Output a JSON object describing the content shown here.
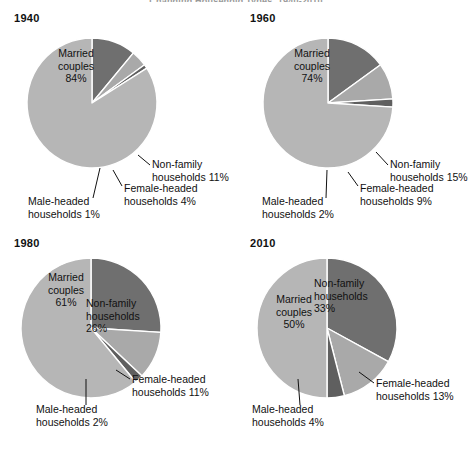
{
  "figure": {
    "title": "Changing Household Types, 1940-2010",
    "background": "#ffffff"
  },
  "colors": {
    "married": "#b6b6b6",
    "nonfamily": "#6f6f6f",
    "female_headed": "#a9a9a9",
    "male_headed": "#5f5f5f",
    "text": "#111111",
    "separator": "#ffffff"
  },
  "legend_categories": [
    "Married couples",
    "Non-family households",
    "Female-headed households",
    "Male-headed households"
  ],
  "panels": [
    {
      "year": "1940",
      "labels": {
        "married": {
          "line1": "Married",
          "line2": "couples",
          "line3": "84%"
        },
        "nonfamily": {
          "line1": "Non-family",
          "line2": "households 11%"
        },
        "female": {
          "line1": "Female-headed",
          "line2": "households 4%"
        },
        "male": {
          "line1": "Male-headed",
          "line2": "households 1%"
        }
      }
    },
    {
      "year": "1960",
      "labels": {
        "married": {
          "line1": "Married",
          "line2": "couples",
          "line3": "74%"
        },
        "nonfamily": {
          "line1": "Non-family",
          "line2": "households 15%"
        },
        "female": {
          "line1": "Female-headed",
          "line2": "households 9%"
        },
        "male": {
          "line1": "Male-headed",
          "line2": "households 2%"
        }
      }
    },
    {
      "year": "1980",
      "labels": {
        "married": {
          "line1": "Married",
          "line2": "couples",
          "line3": "61%"
        },
        "nonfamily": {
          "line1": "Non-family",
          "line2": "households",
          "line3": "26%"
        },
        "female": {
          "line1": "Female-headed",
          "line2": "households 11%"
        },
        "male": {
          "line1": "Male-headed",
          "line2": "households 2%"
        }
      }
    },
    {
      "year": "2010",
      "labels": {
        "married": {
          "line1": "Married",
          "line2": "couples",
          "line3": "50%"
        },
        "nonfamily": {
          "line1": "Non-family",
          "line2": "households",
          "line3": "33%"
        },
        "female": {
          "line1": "Female-headed",
          "line2": "households 13%"
        },
        "male": {
          "line1": "Male-headed",
          "line2": "households 4%"
        }
      }
    }
  ],
  "chart_data": {
    "type": "pie",
    "title": "Changing Household Types, 1940-2010",
    "unit": "percent",
    "categories": [
      "Married couples",
      "Non-family households",
      "Female-headed households",
      "Male-headed households"
    ],
    "charts": [
      {
        "title": "1940",
        "values": [
          84,
          11,
          4,
          1
        ],
        "slices": [
          {
            "label": "Married couples",
            "value": 84,
            "color": "#b6b6b6"
          },
          {
            "label": "Non-family households",
            "value": 11,
            "color": "#6f6f6f"
          },
          {
            "label": "Female-headed households",
            "value": 4,
            "color": "#a9a9a9"
          },
          {
            "label": "Male-headed households",
            "value": 1,
            "color": "#5f5f5f"
          }
        ]
      },
      {
        "title": "1960",
        "values": [
          74,
          15,
          9,
          2
        ],
        "slices": [
          {
            "label": "Married couples",
            "value": 74,
            "color": "#b6b6b6"
          },
          {
            "label": "Non-family households",
            "value": 15,
            "color": "#6f6f6f"
          },
          {
            "label": "Female-headed households",
            "value": 9,
            "color": "#a9a9a9"
          },
          {
            "label": "Male-headed households",
            "value": 2,
            "color": "#5f5f5f"
          }
        ]
      },
      {
        "title": "1980",
        "values": [
          61,
          26,
          11,
          2
        ],
        "slices": [
          {
            "label": "Married couples",
            "value": 61,
            "color": "#b6b6b6"
          },
          {
            "label": "Non-family households",
            "value": 26,
            "color": "#6f6f6f"
          },
          {
            "label": "Female-headed households",
            "value": 11,
            "color": "#a9a9a9"
          },
          {
            "label": "Male-headed households",
            "value": 2,
            "color": "#5f5f5f"
          }
        ]
      },
      {
        "title": "2010",
        "values": [
          50,
          33,
          13,
          4
        ],
        "slices": [
          {
            "label": "Married couples",
            "value": 50,
            "color": "#b6b6b6"
          },
          {
            "label": "Non-family households",
            "value": 33,
            "color": "#6f6f6f"
          },
          {
            "label": "Female-headed households",
            "value": 13,
            "color": "#a9a9a9"
          },
          {
            "label": "Male-headed households",
            "value": 4,
            "color": "#5f5f5f"
          }
        ]
      }
    ],
    "legend_position": "none",
    "grid": false,
    "start_angle_deg": 0,
    "direction": "clockwise"
  }
}
